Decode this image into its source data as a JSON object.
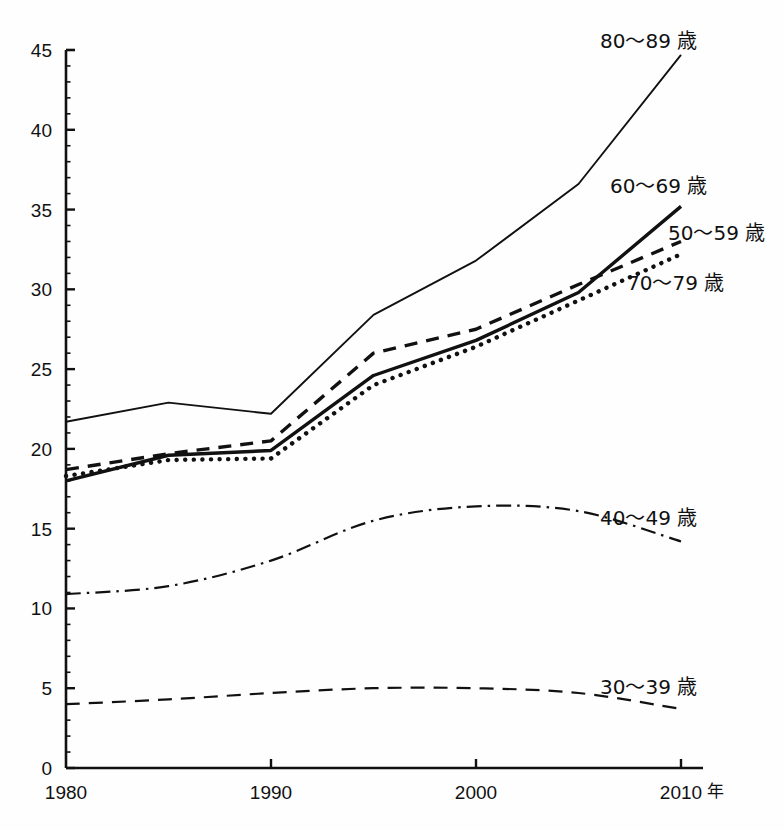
{
  "chart_data": {
    "type": "line",
    "title": "",
    "subtitle": "",
    "xlabel": "年",
    "ylabel": "",
    "x": [
      1980,
      1985,
      1990,
      1995,
      2000,
      2005,
      2010
    ],
    "xtick_labels": [
      "1980",
      "1990",
      "2000",
      "2010"
    ],
    "xticks": [
      1980,
      1990,
      2000,
      2010
    ],
    "xlim": [
      1980,
      2010
    ],
    "ytick_labels": [
      "0",
      "5",
      "10",
      "15",
      "20",
      "25",
      "30",
      "35",
      "40",
      "45"
    ],
    "yticks": [
      0,
      5,
      10,
      15,
      20,
      25,
      30,
      35,
      40,
      45
    ],
    "ylim": [
      0,
      45
    ],
    "grid": false,
    "legend_position": "inline-right",
    "series": [
      {
        "name": "80〜89 歳",
        "style": "solid-thin",
        "values": [
          21.7,
          22.9,
          22.2,
          28.4,
          31.8,
          36.6,
          44.7
        ],
        "label_x": 2009,
        "label_y": 44.0
      },
      {
        "name": "60〜69 歳",
        "style": "solid-thick",
        "values": [
          18.0,
          19.6,
          19.9,
          24.6,
          26.8,
          29.8,
          35.2
        ],
        "label_x": 2007,
        "label_y": 36.8
      },
      {
        "name": "50〜59 歳",
        "style": "dashed",
        "values": [
          18.7,
          19.7,
          20.5,
          26.0,
          27.5,
          30.3,
          33.0
        ],
        "label_x": 2010,
        "label_y": 33.9
      },
      {
        "name": "70〜79 歳",
        "style": "dotted",
        "values": [
          18.3,
          19.3,
          19.4,
          24.0,
          26.4,
          29.3,
          32.2
        ],
        "label_x": 2008,
        "label_y": 30.5
      },
      {
        "name": "40〜49 歳",
        "style": "dash-dot",
        "values": [
          10.9,
          11.4,
          13.0,
          15.5,
          16.4,
          16.1,
          14.2
        ],
        "label_x": 2007,
        "label_y": 16.0
      },
      {
        "name": "30〜39 歳",
        "style": "dashed-long",
        "values": [
          4.0,
          4.3,
          4.7,
          5.0,
          5.0,
          4.7,
          3.7
        ],
        "label_x": 2007,
        "label_y": 5.3
      }
    ],
    "colors": {
      "line": "#111111",
      "axis": "#111111",
      "background": "#ffffff"
    }
  }
}
